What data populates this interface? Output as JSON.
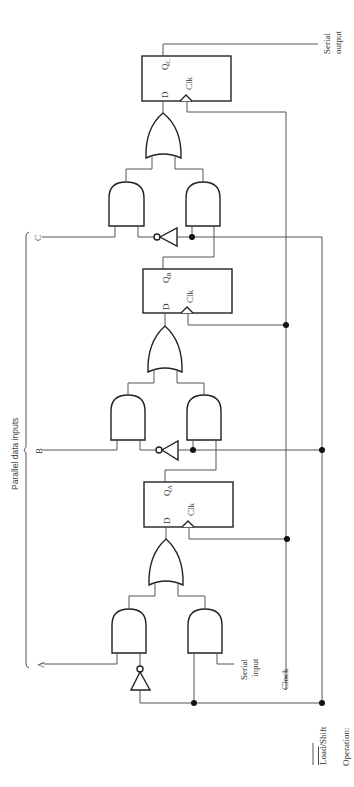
{
  "diagram": {
    "parallel_label": "Parallel data inputs",
    "inputs": {
      "a": "A",
      "b": "B",
      "c": "C"
    },
    "serial_input": [
      "Serial",
      "input"
    ],
    "serial_output": [
      "Serial",
      "output"
    ],
    "clock": "Clock",
    "load_shift": {
      "load": "Load",
      "sep": "/",
      "shift": "Shift"
    },
    "operation": "Operation:",
    "flipflops": [
      {
        "id": "A",
        "d": "D",
        "q": "Q",
        "sub": "A",
        "clk": "Clk"
      },
      {
        "id": "B",
        "d": "D",
        "q": "Q",
        "sub": "B",
        "clk": "Clk"
      },
      {
        "id": "C",
        "d": "D",
        "q": "Q",
        "sub": "C",
        "clk": "Clk"
      }
    ]
  }
}
